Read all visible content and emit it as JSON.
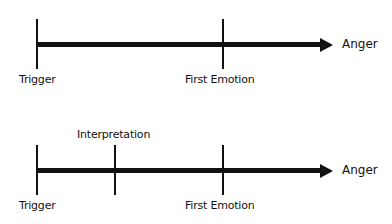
{
  "diagram": {
    "timelines": [
      {
        "id": "without-interpretation",
        "end_label": "Anger",
        "markers": [
          {
            "label": "Trigger",
            "label_position": "below"
          },
          {
            "label": "First Emotion",
            "label_position": "below"
          }
        ]
      },
      {
        "id": "with-interpretation",
        "end_label": "Anger",
        "markers": [
          {
            "label": "Trigger",
            "label_position": "below"
          },
          {
            "label": "Interpretation",
            "label_position": "above"
          },
          {
            "label": "First Emotion",
            "label_position": "below"
          }
        ]
      }
    ],
    "colors": {
      "line": "#111111",
      "background": "#ffffff"
    }
  }
}
